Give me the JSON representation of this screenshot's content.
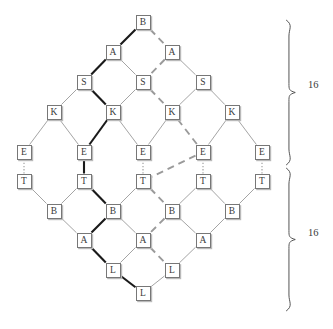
{
  "figure": {
    "type": "trellis-diagram",
    "title": "",
    "caption": ""
  },
  "colors": {
    "node_border": "#777777",
    "node_fill": "#ffffff",
    "node_shadow": "#b9b9b9",
    "edge_normal": "#9a9a9a",
    "edge_bold": "#1a1a1a",
    "edge_dashed": "#9a9a9a",
    "edge_dotted": "#9a9a9a",
    "text": "#3a3a3a",
    "brace": "#555555"
  },
  "nodes": [
    {
      "id": "n0_0",
      "label": "B",
      "x": 143,
      "y": 22,
      "row": 0
    },
    {
      "id": "n1_0",
      "label": "A",
      "x": 113,
      "y": 52,
      "row": 1
    },
    {
      "id": "n1_1",
      "label": "A",
      "x": 172,
      "y": 52,
      "row": 1
    },
    {
      "id": "n2_0",
      "label": "S",
      "x": 84,
      "y": 82,
      "row": 2
    },
    {
      "id": "n2_1",
      "label": "S",
      "x": 143,
      "y": 82,
      "row": 2
    },
    {
      "id": "n2_2",
      "label": "S",
      "x": 203,
      "y": 82,
      "row": 2
    },
    {
      "id": "n3_0",
      "label": "K",
      "x": 54,
      "y": 112,
      "row": 3
    },
    {
      "id": "n3_1",
      "label": "K",
      "x": 113,
      "y": 112,
      "row": 3
    },
    {
      "id": "n3_2",
      "label": "K",
      "x": 172,
      "y": 112,
      "row": 3
    },
    {
      "id": "n3_3",
      "label": "K",
      "x": 232,
      "y": 112,
      "row": 3
    },
    {
      "id": "n4_0",
      "label": "E",
      "x": 24,
      "y": 152,
      "row": 4
    },
    {
      "id": "n4_1",
      "label": "E",
      "x": 84,
      "y": 152,
      "row": 4
    },
    {
      "id": "n4_2",
      "label": "E",
      "x": 143,
      "y": 152,
      "row": 4
    },
    {
      "id": "n4_3",
      "label": "E",
      "x": 203,
      "y": 152,
      "row": 4
    },
    {
      "id": "n4_4",
      "label": "E",
      "x": 262,
      "y": 152,
      "row": 4
    },
    {
      "id": "n5_0",
      "label": "T",
      "x": 24,
      "y": 181,
      "row": 5
    },
    {
      "id": "n5_1",
      "label": "T",
      "x": 84,
      "y": 181,
      "row": 5
    },
    {
      "id": "n5_2",
      "label": "T",
      "x": 143,
      "y": 181,
      "row": 5
    },
    {
      "id": "n5_3",
      "label": "T",
      "x": 203,
      "y": 181,
      "row": 5
    },
    {
      "id": "n5_4",
      "label": "T",
      "x": 262,
      "y": 181,
      "row": 5
    },
    {
      "id": "n6_0",
      "label": "B",
      "x": 54,
      "y": 211,
      "row": 6
    },
    {
      "id": "n6_1",
      "label": "B",
      "x": 113,
      "y": 211,
      "row": 6
    },
    {
      "id": "n6_2",
      "label": "B",
      "x": 172,
      "y": 211,
      "row": 6
    },
    {
      "id": "n6_3",
      "label": "B",
      "x": 232,
      "y": 211,
      "row": 6
    },
    {
      "id": "n7_0",
      "label": "A",
      "x": 84,
      "y": 240,
      "row": 7
    },
    {
      "id": "n7_1",
      "label": "A",
      "x": 143,
      "y": 240,
      "row": 7
    },
    {
      "id": "n7_2",
      "label": "A",
      "x": 203,
      "y": 240,
      "row": 7
    },
    {
      "id": "n8_0",
      "label": "L",
      "x": 113,
      "y": 270,
      "row": 8
    },
    {
      "id": "n8_1",
      "label": "L",
      "x": 172,
      "y": 270,
      "row": 8
    },
    {
      "id": "n9_0",
      "label": "L",
      "x": 143,
      "y": 293,
      "row": 9
    }
  ],
  "edges": [
    {
      "from": "n0_0",
      "to": "n1_0",
      "style": "bold"
    },
    {
      "from": "n0_0",
      "to": "n1_1",
      "style": "dashed"
    },
    {
      "from": "n1_0",
      "to": "n2_0",
      "style": "bold"
    },
    {
      "from": "n1_0",
      "to": "n2_1",
      "style": "normal"
    },
    {
      "from": "n1_1",
      "to": "n2_1",
      "style": "dashed"
    },
    {
      "from": "n1_1",
      "to": "n2_2",
      "style": "normal"
    },
    {
      "from": "n2_0",
      "to": "n3_0",
      "style": "normal"
    },
    {
      "from": "n2_0",
      "to": "n3_1",
      "style": "bold"
    },
    {
      "from": "n2_1",
      "to": "n3_1",
      "style": "normal"
    },
    {
      "from": "n2_1",
      "to": "n3_2",
      "style": "dashed"
    },
    {
      "from": "n2_2",
      "to": "n3_2",
      "style": "normal"
    },
    {
      "from": "n2_2",
      "to": "n3_3",
      "style": "normal"
    },
    {
      "from": "n3_0",
      "to": "n4_0",
      "style": "normal"
    },
    {
      "from": "n3_0",
      "to": "n4_1",
      "style": "normal"
    },
    {
      "from": "n3_1",
      "to": "n4_1",
      "style": "bold"
    },
    {
      "from": "n3_1",
      "to": "n4_2",
      "style": "normal"
    },
    {
      "from": "n3_2",
      "to": "n4_2",
      "style": "normal"
    },
    {
      "from": "n3_2",
      "to": "n4_3",
      "style": "dashed"
    },
    {
      "from": "n3_3",
      "to": "n4_3",
      "style": "normal"
    },
    {
      "from": "n3_3",
      "to": "n4_4",
      "style": "normal"
    },
    {
      "from": "n4_0",
      "to": "n5_0",
      "style": "dotted"
    },
    {
      "from": "n4_1",
      "to": "n5_1",
      "style": "bold"
    },
    {
      "from": "n4_2",
      "to": "n5_2",
      "style": "dotted"
    },
    {
      "from": "n4_3",
      "to": "n5_3",
      "style": "dotted"
    },
    {
      "from": "n4_4",
      "to": "n5_4",
      "style": "dotted"
    },
    {
      "from": "n4_3",
      "to": "n5_2",
      "style": "dashed"
    },
    {
      "from": "n5_0",
      "to": "n6_0",
      "style": "normal"
    },
    {
      "from": "n5_1",
      "to": "n6_0",
      "style": "normal"
    },
    {
      "from": "n5_1",
      "to": "n6_1",
      "style": "bold"
    },
    {
      "from": "n5_2",
      "to": "n6_1",
      "style": "normal"
    },
    {
      "from": "n5_2",
      "to": "n6_2",
      "style": "dashed"
    },
    {
      "from": "n5_3",
      "to": "n6_2",
      "style": "normal"
    },
    {
      "from": "n5_3",
      "to": "n6_3",
      "style": "normal"
    },
    {
      "from": "n5_4",
      "to": "n6_3",
      "style": "normal"
    },
    {
      "from": "n6_0",
      "to": "n7_0",
      "style": "normal"
    },
    {
      "from": "n6_1",
      "to": "n7_0",
      "style": "bold"
    },
    {
      "from": "n6_1",
      "to": "n7_1",
      "style": "normal"
    },
    {
      "from": "n6_2",
      "to": "n7_1",
      "style": "dashed"
    },
    {
      "from": "n6_2",
      "to": "n7_2",
      "style": "normal"
    },
    {
      "from": "n6_3",
      "to": "n7_2",
      "style": "normal"
    },
    {
      "from": "n7_0",
      "to": "n8_0",
      "style": "bold"
    },
    {
      "from": "n7_1",
      "to": "n8_0",
      "style": "normal"
    },
    {
      "from": "n7_1",
      "to": "n8_1",
      "style": "dashed"
    },
    {
      "from": "n7_2",
      "to": "n8_1",
      "style": "normal"
    },
    {
      "from": "n8_0",
      "to": "n9_0",
      "style": "bold"
    },
    {
      "from": "n8_1",
      "to": "n9_0",
      "style": "normal"
    }
  ],
  "braces": [
    {
      "id": "brace-top",
      "label": "16",
      "x": 290,
      "y_top": 20,
      "y_bottom": 165,
      "label_x": 308,
      "label_y": 86
    },
    {
      "id": "brace-bottom",
      "label": "16",
      "x": 290,
      "y_top": 168,
      "y_bottom": 311,
      "label_x": 308,
      "label_y": 234
    }
  ]
}
